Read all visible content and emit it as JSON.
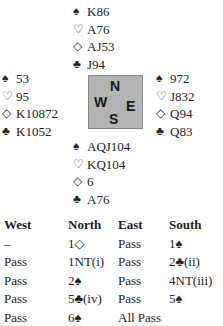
{
  "suits": {
    "spades": "♠",
    "hearts": "♡",
    "diamonds": "◇",
    "clubs": "♣"
  },
  "hands": {
    "north": {
      "spades": "K86",
      "hearts": "A76",
      "diamonds": "AJ53",
      "clubs": "J94"
    },
    "west": {
      "spades": "53",
      "hearts": "95",
      "diamonds": "K10872",
      "clubs": "K1052"
    },
    "east": {
      "spades": "972",
      "hearts": "J832",
      "diamonds": "Q94",
      "clubs": "Q83"
    },
    "south": {
      "spades": "AQJ104",
      "hearts": "KQ104",
      "diamonds": "6",
      "clubs": "A76"
    }
  },
  "compass": {
    "n": "N",
    "w": "W",
    "e": "E",
    "s": "S",
    "background": "#b3b3b3"
  },
  "bidding": {
    "headers": [
      "West",
      "North",
      "East",
      "South"
    ],
    "rows": [
      [
        "–",
        "1◇",
        "Pass",
        "1♠"
      ],
      [
        "Pass",
        "1NT(i)",
        "Pass",
        "2♣(ii)"
      ],
      [
        "Pass",
        "2♠",
        "Pass",
        "4NT(iii)"
      ],
      [
        "Pass",
        "5♣(iv)",
        "Pass",
        "5♠"
      ],
      [
        "Pass",
        "6♠",
        "All Pass",
        ""
      ]
    ]
  }
}
